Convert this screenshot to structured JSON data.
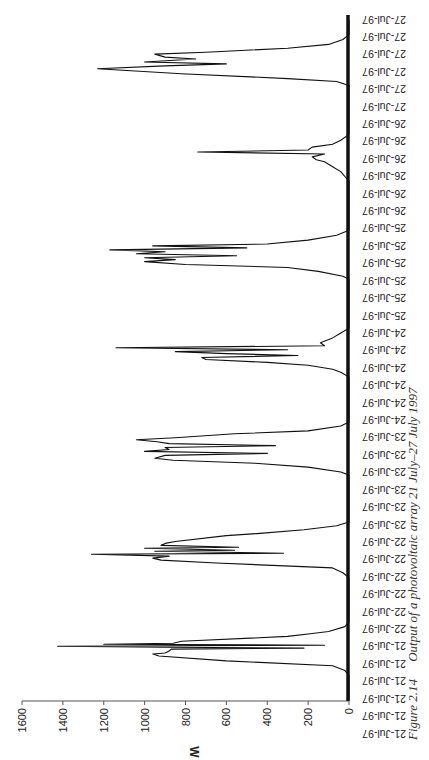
{
  "chart_data": {
    "type": "line",
    "orientation": "rotated-90-clockwise",
    "title": "",
    "caption": {
      "number": "Figure 2.14",
      "text": "Output of a photovoltaic array 21 July–27 July 1997"
    },
    "xlabel": "",
    "ylabel": "W",
    "ylim": [
      0,
      1600
    ],
    "yticks": [
      0,
      200,
      400,
      600,
      800,
      1000,
      1200,
      1400,
      1600
    ],
    "grid": false,
    "legend": null,
    "x_tick_labels": [
      "21-Jul-97",
      "21-Jul-97",
      "21-Jul-97",
      "21-Jul-97",
      "21-Jul-97",
      "21-Jul-97",
      "22-Jul-97",
      "22-Jul-97",
      "22-Jul-97",
      "22-Jul-97",
      "22-Jul-97",
      "22-Jul-97",
      "23-Jul-97",
      "23-Jul-97",
      "23-Jul-97",
      "23-Jul-97",
      "23-Jul-97",
      "23-Jul-97",
      "24-Jul-97",
      "24-Jul-97",
      "24-Jul-97",
      "24-Jul-97",
      "24-Jul-97",
      "24-Jul-97",
      "25-Jul-97",
      "25-Jul-97",
      "25-Jul-97",
      "25-Jul-97",
      "25-Jul-97",
      "25-Jul-97",
      "26-Jul-97",
      "26-Jul-97",
      "26-Jul-97",
      "26-Jul-97",
      "26-Jul-97",
      "26-Jul-97",
      "27-Jul-97",
      "27-Jul-97",
      "27-Jul-97",
      "27-Jul-97",
      "27-Jul-97",
      "27-Jul-97"
    ],
    "series": [
      {
        "name": "PV array output",
        "description": "Daily bell-shaped output curves with cloud-induced spikes; approx (t in days from 21-Jul 00:00, W)",
        "points": [
          [
            0.0,
            0
          ],
          [
            0.25,
            0
          ],
          [
            0.3,
            20
          ],
          [
            0.35,
            80
          ],
          [
            0.4,
            600
          ],
          [
            0.45,
            930
          ],
          [
            0.47,
            960
          ],
          [
            0.48,
            900
          ],
          [
            0.5,
            880
          ],
          [
            0.52,
            870
          ],
          [
            0.53,
            220
          ],
          [
            0.54,
            900
          ],
          [
            0.55,
            1426
          ],
          [
            0.56,
            120
          ],
          [
            0.57,
            1200
          ],
          [
            0.58,
            860
          ],
          [
            0.6,
            820
          ],
          [
            0.65,
            300
          ],
          [
            0.68,
            180
          ],
          [
            0.7,
            100
          ],
          [
            0.75,
            20
          ],
          [
            0.8,
            0
          ],
          [
            1.0,
            0
          ],
          [
            1.25,
            0
          ],
          [
            1.3,
            30
          ],
          [
            1.35,
            80
          ],
          [
            1.4,
            650
          ],
          [
            1.43,
            920
          ],
          [
            1.45,
            960
          ],
          [
            1.47,
            880
          ],
          [
            1.49,
            1260
          ],
          [
            1.5,
            320
          ],
          [
            1.52,
            950
          ],
          [
            1.53,
            560
          ],
          [
            1.55,
            1000
          ],
          [
            1.56,
            540
          ],
          [
            1.58,
            920
          ],
          [
            1.6,
            900
          ],
          [
            1.62,
            850
          ],
          [
            1.68,
            600
          ],
          [
            1.7,
            450
          ],
          [
            1.74,
            220
          ],
          [
            1.78,
            60
          ],
          [
            1.82,
            0
          ],
          [
            2.0,
            0
          ],
          [
            2.3,
            0
          ],
          [
            2.33,
            40
          ],
          [
            2.38,
            200
          ],
          [
            2.42,
            460
          ],
          [
            2.45,
            860
          ],
          [
            2.47,
            950
          ],
          [
            2.5,
            900
          ],
          [
            2.52,
            400
          ],
          [
            2.54,
            1000
          ],
          [
            2.56,
            880
          ],
          [
            2.58,
            900
          ],
          [
            2.6,
            360
          ],
          [
            2.62,
            880
          ],
          [
            2.64,
            940
          ],
          [
            2.66,
            1040
          ],
          [
            2.68,
            850
          ],
          [
            2.72,
            560
          ],
          [
            2.75,
            200
          ],
          [
            2.8,
            40
          ],
          [
            2.84,
            0
          ],
          [
            3.0,
            0
          ],
          [
            3.3,
            0
          ],
          [
            3.35,
            40
          ],
          [
            3.38,
            80
          ],
          [
            3.42,
            200
          ],
          [
            3.45,
            400
          ],
          [
            3.48,
            700
          ],
          [
            3.5,
            720
          ],
          [
            3.52,
            250
          ],
          [
            3.54,
            600
          ],
          [
            3.56,
            850
          ],
          [
            3.58,
            300
          ],
          [
            3.6,
            1140
          ],
          [
            3.62,
            120
          ],
          [
            3.65,
            140
          ],
          [
            3.7,
            80
          ],
          [
            3.75,
            40
          ],
          [
            3.8,
            0
          ],
          [
            4.0,
            0
          ],
          [
            4.3,
            0
          ],
          [
            4.33,
            30
          ],
          [
            4.38,
            150
          ],
          [
            4.42,
            300
          ],
          [
            4.45,
            800
          ],
          [
            4.48,
            1000
          ],
          [
            4.5,
            850
          ],
          [
            4.52,
            1000
          ],
          [
            4.54,
            550
          ],
          [
            4.56,
            1040
          ],
          [
            4.58,
            900
          ],
          [
            4.6,
            1170
          ],
          [
            4.62,
            500
          ],
          [
            4.64,
            960
          ],
          [
            4.66,
            400
          ],
          [
            4.7,
            200
          ],
          [
            4.75,
            60
          ],
          [
            4.8,
            0
          ],
          [
            5.0,
            0
          ],
          [
            5.3,
            0
          ],
          [
            5.35,
            20
          ],
          [
            5.4,
            40
          ],
          [
            5.45,
            80
          ],
          [
            5.5,
            120
          ],
          [
            5.52,
            160
          ],
          [
            5.55,
            180
          ],
          [
            5.58,
            120
          ],
          [
            5.6,
            740
          ],
          [
            5.62,
            200
          ],
          [
            5.65,
            180
          ],
          [
            5.68,
            80
          ],
          [
            5.72,
            40
          ],
          [
            5.78,
            0
          ],
          [
            6.0,
            0
          ],
          [
            6.28,
            0
          ],
          [
            6.32,
            60
          ],
          [
            6.35,
            300
          ],
          [
            6.4,
            820
          ],
          [
            6.45,
            1230
          ],
          [
            6.48,
            900
          ],
          [
            6.5,
            600
          ],
          [
            6.52,
            1000
          ],
          [
            6.55,
            750
          ],
          [
            6.57,
            900
          ],
          [
            6.6,
            950
          ],
          [
            6.62,
            700
          ],
          [
            6.66,
            300
          ],
          [
            6.7,
            100
          ],
          [
            6.75,
            30
          ],
          [
            6.8,
            0
          ],
          [
            6.95,
            0
          ]
        ]
      }
    ],
    "colors": {
      "line": "#111111",
      "axis": "#222222",
      "background": "#ffffff"
    }
  }
}
